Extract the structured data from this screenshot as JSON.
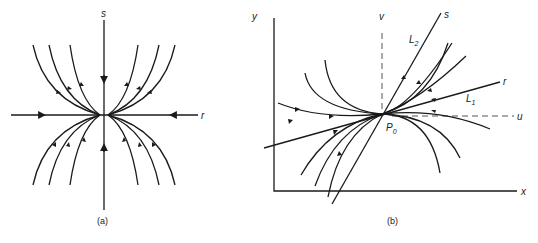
{
  "figure": {
    "panel_a": {
      "caption": "(a)",
      "axis_h_label": "r",
      "axis_v_label": "s",
      "description": "Improper node: trajectories converge to origin, tangent to r-axis"
    },
    "panel_b": {
      "caption": "(b)",
      "axis_x_label": "x",
      "axis_y_label": "y",
      "line_v_label": "v",
      "line_u_label": "u",
      "line_s_label": "s",
      "line_r_label": "r",
      "L2_main": "L",
      "L2_sub": "2",
      "L1_main": "L",
      "L1_sub": "1",
      "P0_main": "P",
      "P0_sub": "0"
    },
    "colors": {
      "stroke": "#1a1a1a",
      "dashed": "#555555",
      "background": "#ffffff"
    }
  }
}
